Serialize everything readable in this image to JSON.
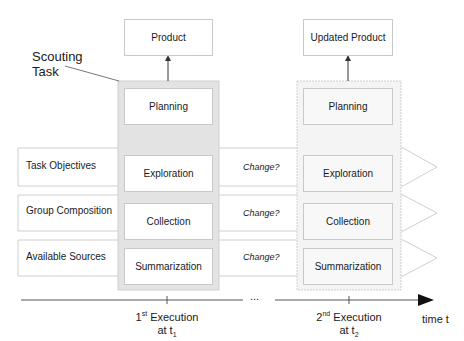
{
  "title": {
    "line1": "Scouting",
    "line2": "Task"
  },
  "execution1": {
    "product": "Product",
    "phases": [
      "Planning",
      "Exploration",
      "Collection",
      "Summarization"
    ]
  },
  "execution2": {
    "product": "Updated Product",
    "phases": [
      "Planning",
      "Exploration",
      "Collection",
      "Summarization"
    ]
  },
  "rows": [
    {
      "label": "Task Objectives",
      "change": "Change?"
    },
    {
      "label": "Group Composition",
      "change": "Change?"
    },
    {
      "label": "Available Sources",
      "change": "Change?"
    }
  ],
  "timeline": {
    "ellipsis": "...",
    "axis_label": "time t",
    "t1": {
      "ord": "1",
      "sup": "st",
      "word": "Execution",
      "at": "at t",
      "sub": "1"
    },
    "t2": {
      "ord": "2",
      "sup": "nd",
      "word": "Execution",
      "at": "at t",
      "sub": "2"
    }
  }
}
